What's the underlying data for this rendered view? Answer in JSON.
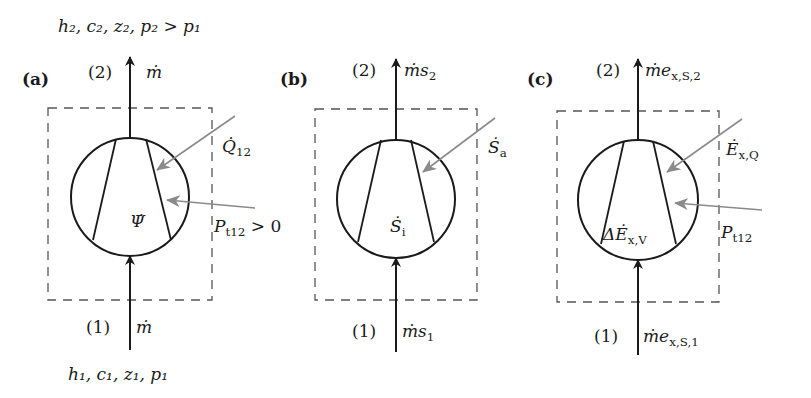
{
  "colors": {
    "ink": "#1a1a1a",
    "gray_arrow": "#8a8a8a",
    "dash": "#555555",
    "background": "#ffffff"
  },
  "top_state_label": {
    "text": "h₂, c₂, z₂, p₂ > p₁",
    "x": 58,
    "y": 32
  },
  "bottom_state_label": {
    "text": "h₁, c₁, z₁, p₁",
    "x": 68,
    "y": 380
  },
  "panels": [
    {
      "id": "a",
      "panel_label": "(a)",
      "label_x": 22,
      "label_y": 85,
      "cx": 130,
      "cy": 197,
      "r": 59,
      "box": {
        "x1": 48,
        "y1": 108,
        "x2": 212,
        "y2": 300
      },
      "trap": {
        "tl": [
          116,
          139
        ],
        "bl": [
          93,
          240
        ],
        "tr": [
          146,
          139
        ],
        "br": [
          171,
          240
        ]
      },
      "outlet": {
        "port": "(2)",
        "port_x": 88,
        "flow": "ṁ",
        "flow_x": 146,
        "y": 78,
        "tip_y": 57
      },
      "inlet": {
        "port": "(1)",
        "port_x": 86,
        "flow": "ṁ",
        "flow_x": 136,
        "y": 333,
        "start_y": 350
      },
      "center_symbol": {
        "text": "Ψ̇",
        "x": 130,
        "y": 227
      },
      "arrows_in": [
        {
          "name": "heat-flow-arrow",
          "from": [
            235,
            116
          ],
          "to": [
            157,
            170
          ],
          "label": "Q̇",
          "sub": "12",
          "lx": 222,
          "ly": 152
        },
        {
          "name": "power-arrow",
          "from": [
            255,
            208
          ],
          "to": [
            167,
            200
          ],
          "label": "P",
          "sub": "t12",
          "tail": " > 0",
          "lx": 214,
          "ly": 232
        }
      ]
    },
    {
      "id": "b",
      "panel_label": "(b)",
      "label_x": 280,
      "label_y": 85,
      "cx": 396,
      "cy": 199,
      "r": 59,
      "box": {
        "x1": 315,
        "y1": 109,
        "x2": 477,
        "y2": 300
      },
      "trap": {
        "tl": [
          381,
          140
        ],
        "bl": [
          358,
          242
        ],
        "tr": [
          411,
          140
        ],
        "br": [
          434,
          242
        ]
      },
      "outlet": {
        "port": "(2)",
        "port_x": 352,
        "flow": "ṁs",
        "flow_sub": "2",
        "flow_x": 404,
        "y": 76,
        "tip_y": 59
      },
      "inlet": {
        "port": "(1)",
        "port_x": 352,
        "flow": "ṁs",
        "flow_sub": "1",
        "flow_x": 402,
        "y": 337,
        "start_y": 352
      },
      "center_symbol": {
        "text": "Ṡ",
        "sub": "i",
        "x": 390,
        "y": 232
      },
      "arrows_in": [
        {
          "name": "entropy-transfer-arrow",
          "from": [
            495,
            118
          ],
          "to": [
            423,
            172
          ],
          "label": "Ṡ",
          "sub": "a",
          "lx": 488,
          "ly": 153
        }
      ]
    },
    {
      "id": "c",
      "panel_label": "(c)",
      "label_x": 527,
      "label_y": 85,
      "cx": 638,
      "cy": 200,
      "r": 60,
      "box": {
        "x1": 557,
        "y1": 111,
        "x2": 719,
        "y2": 302
      },
      "trap": {
        "tl": [
          624,
          141
        ],
        "bl": [
          601,
          244
        ],
        "tr": [
          653,
          141
        ],
        "br": [
          676,
          244
        ]
      },
      "outlet": {
        "port": "(2)",
        "port_x": 596,
        "flow": "ṁe",
        "flow_sub": "x,S,2",
        "flow_x": 645,
        "y": 76,
        "tip_y": 59
      },
      "inlet": {
        "port": "(1)",
        "port_x": 594,
        "flow": "ṁe",
        "flow_sub": "x,S,1",
        "flow_x": 643,
        "y": 342,
        "start_y": 355
      },
      "center_symbol": {
        "text": "ΔĖ",
        "sub": "x,V",
        "x": 603,
        "y": 240
      },
      "arrows_in": [
        {
          "name": "exergy-heat-arrow",
          "from": [
            742,
            119
          ],
          "to": [
            667,
            172
          ],
          "label": "Ė",
          "sub": "x,Q",
          "lx": 726,
          "ly": 155
        },
        {
          "name": "power-arrow",
          "from": [
            762,
            210
          ],
          "to": [
            675,
            203
          ],
          "label": "P",
          "sub": "t12",
          "lx": 721,
          "ly": 238
        }
      ]
    }
  ]
}
